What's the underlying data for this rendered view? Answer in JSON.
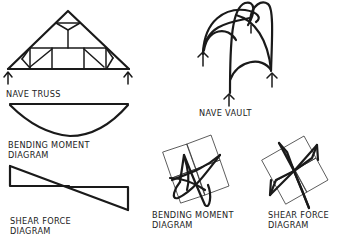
{
  "figure": {
    "type": "hand-drawn structural diagram",
    "ink_color": "#1a1a1a",
    "background": "#ffffff"
  },
  "labels": {
    "nave_truss": "NAVE TRUSS",
    "nave_vault": "NAVE VAULT",
    "truss_bending_line1": "BENDING MOMENT",
    "truss_bending_line2": "DIAGRAM",
    "truss_shear_line1": "SHEAR FORCE",
    "truss_shear_line2": "DIAGRAM",
    "vault_bending_line1": "BENDING MOMENT",
    "vault_bending_line2": "DIAGRAM",
    "vault_shear_line1": "SHEAR FORCE",
    "vault_shear_line2": "DIAGRAM"
  },
  "panels": [
    {
      "id": "nave-truss",
      "label_key": "nave_truss"
    },
    {
      "id": "nave-vault",
      "label_key": "nave_vault"
    },
    {
      "id": "truss-bending-moment-diagram",
      "label_key": "truss_bending"
    },
    {
      "id": "truss-shear-force-diagram",
      "label_key": "truss_shear"
    },
    {
      "id": "vault-bending-moment-diagram",
      "label_key": "vault_bending"
    },
    {
      "id": "vault-shear-force-diagram",
      "label_key": "vault_shear"
    }
  ]
}
